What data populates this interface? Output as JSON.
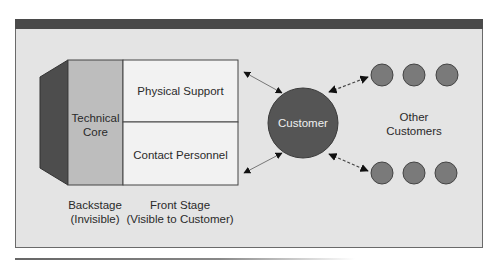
{
  "diagram": {
    "technical_core": {
      "line1": "Technical",
      "line2": "Core"
    },
    "physical_support": "Physical Support",
    "contact_personnel": "Contact Personnel",
    "customer": "Customer",
    "other_customers": {
      "line1": "Other",
      "line2": "Customers"
    },
    "backstage": {
      "line1": "Backstage",
      "line2": "(Invisible)"
    },
    "front_stage": {
      "line1": "Front Stage",
      "line2": "(Visible to Customer)"
    }
  },
  "colors": {
    "frame_bg": "#e4e4e4",
    "top_bar": "#4a4a4a",
    "core_side": "#4d4d4d",
    "core_face": "#bdbdbd",
    "front_stage_bg": "#f2f2f2",
    "customer_fill": "#555555",
    "other_customer_fill": "#7a7a7a"
  }
}
